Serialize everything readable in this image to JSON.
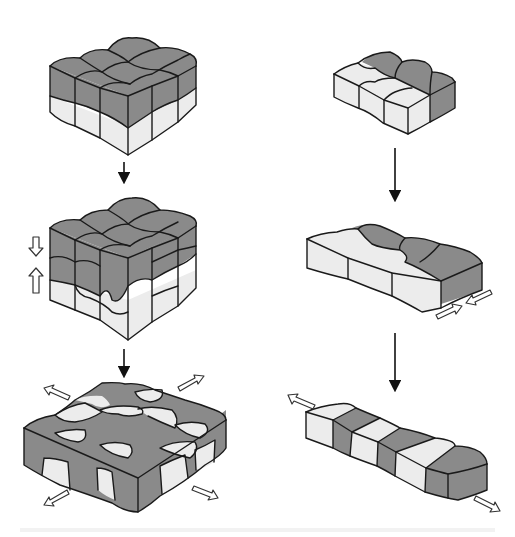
{
  "diagram": {
    "colors": {
      "dark_grain": "#8a8a8a",
      "light_grain": "#ececec",
      "outline": "#1a1a1a",
      "background": "#ffffff"
    },
    "columns": [
      {
        "id": "left",
        "stages": [
          {
            "id": "stack-initial",
            "shape": "3x3 top grid of dark cubes over light cube layer"
          },
          {
            "id": "stack-compressed",
            "shape": "dark layer pressing into light layer with wavy interface",
            "indicator": "opposing vertical hollow arrows (down / up)"
          },
          {
            "id": "slab-final",
            "shape": "flattened checkerboard slab of intermixed dark and light grains",
            "indicator": "four hollow arrows pointing outward diagonally"
          }
        ],
        "connectors": [
          "down-arrow",
          "down-arrow"
        ]
      },
      {
        "id": "right",
        "stages": [
          {
            "id": "block-initial",
            "shape": "3x2 block, light front row and dark back row"
          },
          {
            "id": "block-compressed",
            "shape": "elongated block compressed at the right end",
            "indicator": "pair of hollow arrows pointing toward each other"
          },
          {
            "id": "bar-final",
            "shape": "long bar of alternating light and dark segments",
            "indicator": "hollow arrows at both ends pointing outward"
          }
        ],
        "connectors": [
          "down-arrow",
          "down-arrow"
        ]
      }
    ]
  }
}
